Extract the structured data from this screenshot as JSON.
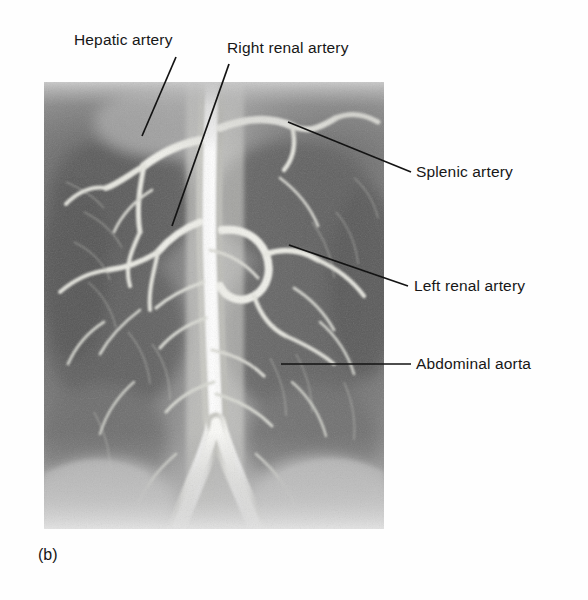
{
  "figure": {
    "panel_caption": "(b)",
    "modality": "abdominal-aortogram",
    "plate": {
      "x": 44,
      "y": 82,
      "width": 340,
      "height": 447,
      "background_hex": "#8d8d8d",
      "description": "Greyscale digital subtraction angiogram of the abdomen showing the aorta and its visceral branches"
    },
    "labels": [
      {
        "id": "hepatic-artery",
        "text": "Hepatic artery",
        "x": 74,
        "y": 31,
        "leader": {
          "x1": 176,
          "y1": 57,
          "x2": 142,
          "y2": 136
        }
      },
      {
        "id": "right-renal-artery",
        "text": "Right renal artery",
        "x": 227,
        "y": 39,
        "leader": {
          "x1": 229,
          "y1": 64,
          "x2": 172,
          "y2": 226
        }
      },
      {
        "id": "splenic-artery",
        "text": "Splenic artery",
        "x": 416,
        "y": 163,
        "leader": {
          "x1": 288,
          "y1": 122,
          "x2": 411,
          "y2": 172
        }
      },
      {
        "id": "left-renal-artery",
        "text": "Left renal artery",
        "x": 414,
        "y": 277,
        "leader": {
          "x1": 289,
          "y1": 245,
          "x2": 408,
          "y2": 286
        }
      },
      {
        "id": "abdominal-aorta",
        "text": "Abdominal aorta",
        "x": 416,
        "y": 355,
        "leader": {
          "x1": 281,
          "y1": 364,
          "x2": 411,
          "y2": 364
        }
      }
    ],
    "colors": {
      "page_background": "#ffffff",
      "label_text": "#171717",
      "leader_line": "#131313",
      "plate_mid_grey": "#8d8d8d",
      "vessel_bright": "#f2f2ee",
      "plate_dark": "#4a4a4a"
    }
  }
}
